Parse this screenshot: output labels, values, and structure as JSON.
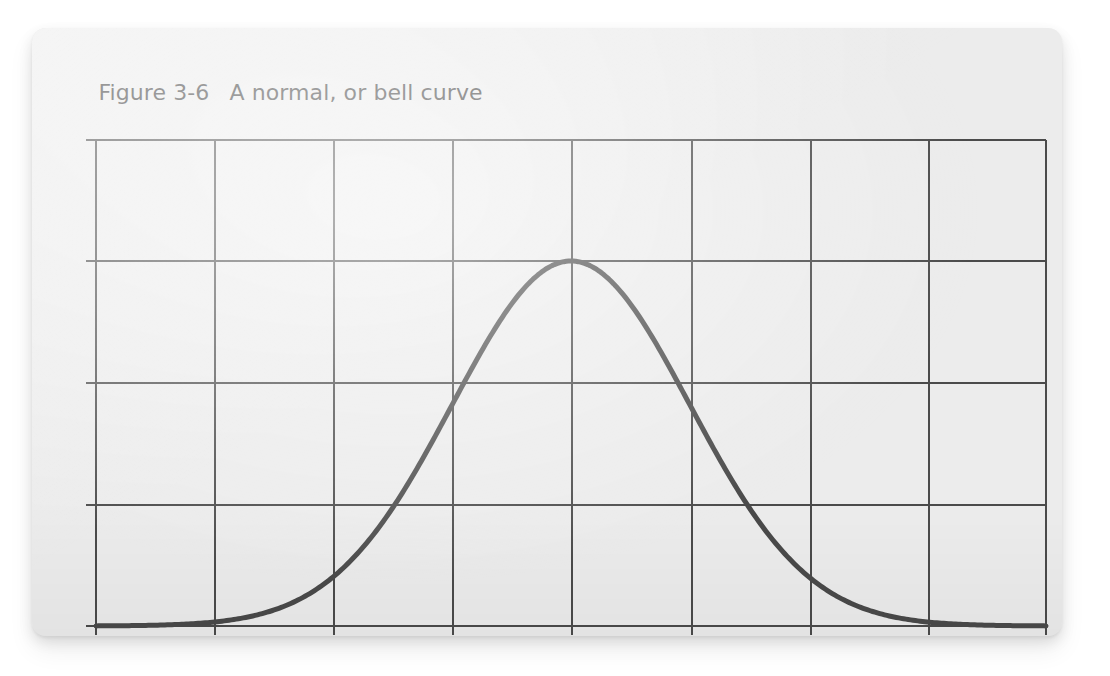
{
  "figure": {
    "label": "Figure 3-6",
    "title": "A normal, or bell curve"
  },
  "colors": {
    "page_background": "#ffffff",
    "card_background": "#ececec",
    "grid_line": "#4b4b4b",
    "curve_stroke": "#4a4a4a",
    "caption_text": "#3b3b3b"
  },
  "chart_data": {
    "type": "line",
    "title": "A normal, or bell curve",
    "xlabel": "",
    "ylabel": "",
    "grid": true,
    "legend": null,
    "axis_tick_labels": {
      "x": [],
      "y": []
    },
    "grid_columns": 8,
    "grid_rows": 4,
    "xlim": [
      -4,
      4
    ],
    "ylim": [
      0,
      1.3333
    ],
    "distribution": {
      "name": "standard normal",
      "mean": 0,
      "sigma": 1,
      "peak_x": 0,
      "peak_y": 1,
      "inflection_x": [
        -1,
        1
      ],
      "inflection_y": 0.6065
    },
    "x": [
      -4,
      -3.75,
      -3.5,
      -3.25,
      -3,
      -2.75,
      -2.5,
      -2.25,
      -2,
      -1.75,
      -1.5,
      -1.25,
      -1,
      -0.75,
      -0.5,
      -0.25,
      0,
      0.25,
      0.5,
      0.75,
      1,
      1.25,
      1.5,
      1.75,
      2,
      2.25,
      2.5,
      2.75,
      3,
      3.25,
      3.5,
      3.75,
      4
    ],
    "y": [
      0.0003,
      0.0009,
      0.0022,
      0.0051,
      0.0111,
      0.0228,
      0.0439,
      0.0796,
      0.1353,
      0.2163,
      0.3247,
      0.4578,
      0.6065,
      0.7548,
      0.8825,
      0.9692,
      1.0,
      0.9692,
      0.8825,
      0.7548,
      0.6065,
      0.4578,
      0.3247,
      0.2163,
      0.1353,
      0.0796,
      0.0439,
      0.0228,
      0.0111,
      0.0051,
      0.0022,
      0.0009,
      0.0003
    ]
  }
}
